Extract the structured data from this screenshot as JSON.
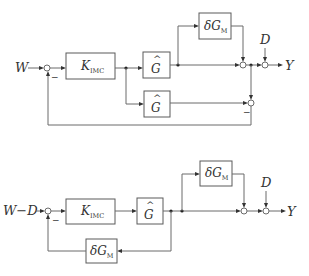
{
  "diagram1": {
    "input_label": "W",
    "output_label": "Y",
    "disturbance_label": "D",
    "controller": {
      "main": "K",
      "sub": "IMC"
    },
    "model_top": {
      "main": "G",
      "hat": "^"
    },
    "model_bottom": {
      "main": "G",
      "hat": "^"
    },
    "uncertainty": {
      "main": "δG",
      "sub": "M"
    },
    "minus_sign_input": "−",
    "minus_sign_compare": "−"
  },
  "diagram2": {
    "input_label": "W−D",
    "output_label": "Y",
    "disturbance_label": "D",
    "controller": {
      "main": "K",
      "sub": "IMC"
    },
    "model": {
      "main": "G",
      "hat": "^"
    },
    "uncertainty_forward": {
      "main": "δG",
      "sub": "M"
    },
    "uncertainty_feedback": {
      "main": "δG",
      "sub": "M"
    },
    "minus_sign_input": "−"
  }
}
